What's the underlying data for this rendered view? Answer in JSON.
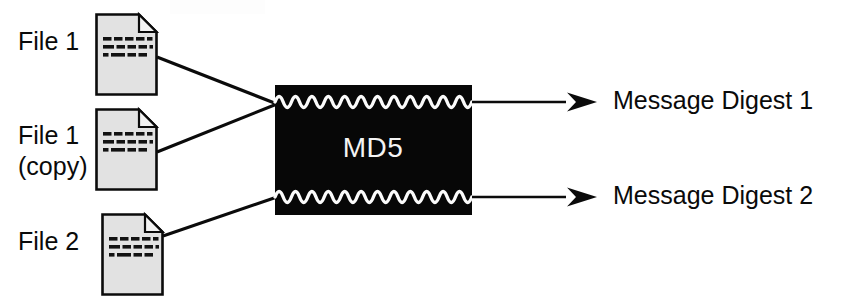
{
  "figure": {
    "background_color": "#ffffff",
    "ink_color": "#0b0b0b"
  },
  "inputs": [
    {
      "id": "file-1",
      "label_lines": [
        "File 1"
      ],
      "label_line_1": "File 1",
      "label_line_2": "",
      "icon": "document-icon",
      "icon_fill": "#e2e2e2",
      "icon_stroke": "#0b0b0b",
      "connects_to": "md5-top-input"
    },
    {
      "id": "file-1-copy",
      "label_lines": [
        "File 1",
        "(copy)"
      ],
      "label_line_1": "File 1",
      "label_line_2": "(copy)",
      "icon": "document-icon",
      "icon_fill": "#e2e2e2",
      "icon_stroke": "#0b0b0b",
      "connects_to": "md5-top-input"
    },
    {
      "id": "file-2",
      "label_lines": [
        "File 2"
      ],
      "label_line_1": "File 2",
      "label_line_2": "",
      "icon": "document-icon",
      "icon_fill": "#e2e2e2",
      "icon_stroke": "#0b0b0b",
      "connects_to": "md5-bottom-input"
    }
  ],
  "processor": {
    "label": "MD5",
    "box_fill": "#070707",
    "text_color": "#f4f4f4",
    "wave_color": "#fbfbfb",
    "wave_cycles": 12,
    "waves": [
      "top-wave",
      "bottom-wave"
    ]
  },
  "outputs": [
    {
      "id": "message-digest-1",
      "label": "Message Digest 1",
      "arrow": "arrow-right-icon",
      "from": "md5-top-output"
    },
    {
      "id": "message-digest-2",
      "label": "Message Digest 2",
      "arrow": "arrow-right-icon",
      "from": "md5-bottom-output"
    }
  ]
}
